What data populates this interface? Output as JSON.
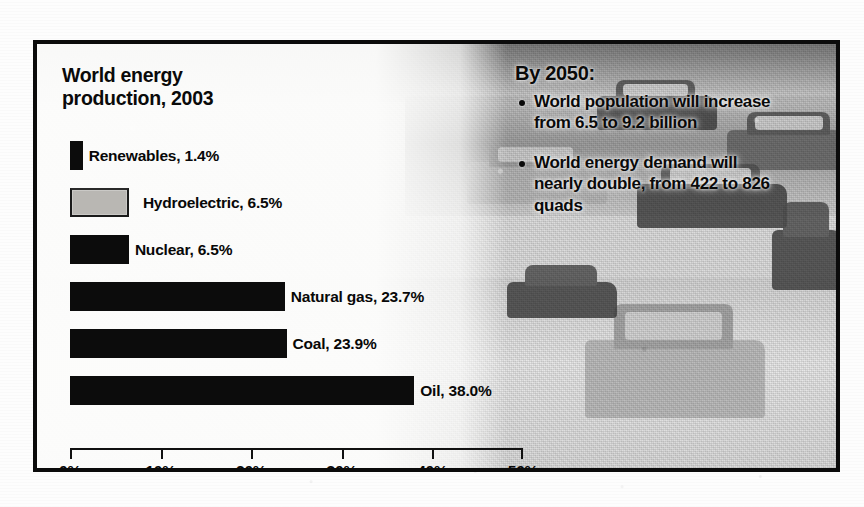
{
  "figure": {
    "frame_color": "#0b0b0b",
    "background_photo": "traffic-highway-cars-photo"
  },
  "chart_data": {
    "type": "bar",
    "orientation": "horizontal",
    "title": "World energy production, 2003",
    "title_line1": "World energy",
    "title_line2": "production, 2003",
    "xlabel": "",
    "ylabel": "",
    "xlim": [
      0,
      50
    ],
    "grid": false,
    "legend": "none",
    "unit": "%",
    "categories": [
      "Renewables",
      "Hydroelectric",
      "Nuclear",
      "Natural gas",
      "Coal",
      "Oil"
    ],
    "values": [
      1.4,
      6.5,
      6.5,
      23.7,
      23.9,
      38.0
    ],
    "bars": [
      {
        "name": "Renewables",
        "value": 1.4,
        "label": "Renewables, 1.4%",
        "fill": "#0c0c0c",
        "style": "solid"
      },
      {
        "name": "Hydroelectric",
        "value": 6.5,
        "label": "Hydroelectric, 6.5%",
        "fill": "#b9b7b3",
        "style": "gray"
      },
      {
        "name": "Nuclear",
        "value": 6.5,
        "label": "Nuclear, 6.5%",
        "fill": "#0c0c0c",
        "style": "solid"
      },
      {
        "name": "Natural gas",
        "value": 23.7,
        "label": "Natural gas, 23.7%",
        "fill": "#0c0c0c",
        "style": "solid"
      },
      {
        "name": "Coal",
        "value": 23.9,
        "label": "Coal, 23.9%",
        "fill": "#0c0c0c",
        "style": "solid"
      },
      {
        "name": "Oil",
        "value": 38.0,
        "label": "Oil, 38.0%",
        "fill": "#0c0c0c",
        "style": "solid"
      }
    ],
    "xticks": [
      0,
      10,
      20,
      30,
      40,
      50
    ],
    "xticklabels": [
      "0%",
      "10%",
      "20%",
      "30%",
      "40%",
      "50%"
    ]
  },
  "forecast": {
    "heading": "By 2050:",
    "bullets": [
      "World population will increase from 6.5 to 9.2 billion",
      "World energy demand will nearly double, from 422 to 826 quads"
    ]
  }
}
